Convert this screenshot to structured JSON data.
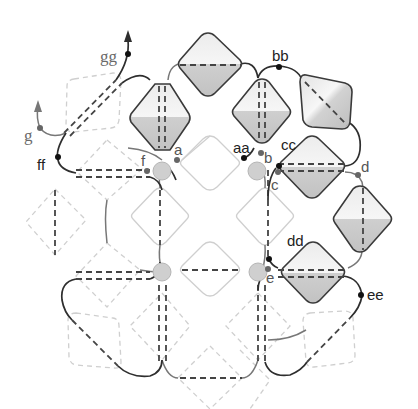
{
  "diagram": {
    "labels": {
      "a": "a",
      "aa": "aa",
      "b": "b",
      "bb": "bb",
      "c": "c",
      "cc": "cc",
      "d": "d",
      "dd": "dd",
      "e": "e",
      "ee": "ee",
      "f": "f",
      "ff": "ff",
      "g": "g",
      "gg": "gg"
    },
    "colors": {
      "solid_bead_fill_light": "#f4f4f4",
      "solid_bead_fill_dark": "#c8c8c8",
      "solid_bead_stroke": "#3a3a3a",
      "faint_bead_stroke": "#cfcfcf",
      "round_bead_fill": "#cfcfcf",
      "thread_new": "#2e2e2e",
      "thread_existing": "#777777"
    },
    "legend": {
      "solid_beads": "new bicone beads (shaded)",
      "faint_beads": "existing bicone beads (outline)",
      "dashed_beads": "beads behind (dashed)",
      "round_beads": "round beads (grey circles)"
    }
  }
}
